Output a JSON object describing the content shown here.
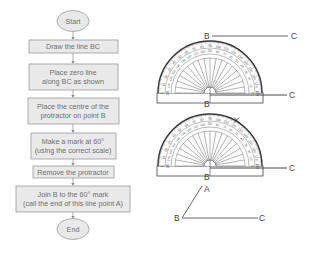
{
  "flowchart": {
    "start": "Start",
    "end": "End",
    "steps": [
      {
        "lines": [
          "Draw the line BC"
        ]
      },
      {
        "lines": [
          "Place zero line",
          "along BC as shown"
        ]
      },
      {
        "lines": [
          "Place the centre of the",
          "protractor on point B"
        ]
      },
      {
        "lines": [
          "Make a mark at 60°",
          "(using the correct scale)"
        ]
      },
      {
        "lines": [
          "Remove the protractor"
        ]
      },
      {
        "lines": [
          "Join B to the 60° mark",
          "(call the end of this line point A)"
        ]
      }
    ],
    "colors": {
      "box_fill": "#e9e9e9",
      "box_stroke": "#9a9a9a",
      "text": "#6f6f6f",
      "arrow": "#8a8a8a"
    }
  },
  "illustrations": {
    "step1_line": {
      "point_b": "B",
      "point_c": "C"
    },
    "protractor_1": {
      "point_b": "B",
      "point_c": "C"
    },
    "protractor_2": {
      "point_b": "B",
      "point_c": "C",
      "mark_angle": 60
    },
    "result": {
      "point_a": "A",
      "point_b": "B",
      "point_c": "C",
      "angle": 60
    }
  },
  "protractor_scale": {
    "outer": [
      0,
      10,
      20,
      30,
      40,
      50,
      60,
      70,
      80,
      90,
      100,
      110,
      120,
      130,
      140,
      150,
      160,
      170,
      180
    ],
    "inner": [
      180,
      170,
      160,
      150,
      140,
      130,
      120,
      110,
      100,
      90,
      80,
      70,
      60,
      50,
      40,
      30,
      20,
      10,
      0
    ]
  }
}
